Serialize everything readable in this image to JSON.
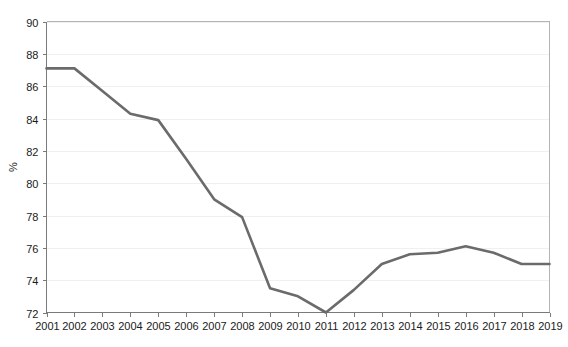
{
  "chart_data": {
    "type": "line",
    "title": "",
    "subtitle": "",
    "xlabel": "",
    "ylabel": "%",
    "categories": [
      "2001",
      "2002",
      "2003",
      "2004",
      "2005",
      "2006",
      "2007",
      "2008",
      "2009",
      "2010",
      "2011",
      "2012",
      "2013",
      "2014",
      "2015",
      "2016",
      "2017",
      "2018",
      "2019"
    ],
    "x": [
      2001,
      2002,
      2003,
      2004,
      2005,
      2006,
      2007,
      2008,
      2009,
      2010,
      2011,
      2012,
      2013,
      2014,
      2015,
      2016,
      2017,
      2018,
      2019
    ],
    "values": [
      87.1,
      87.1,
      85.7,
      84.3,
      83.9,
      81.5,
      79.0,
      77.9,
      73.5,
      73.0,
      72.0,
      73.4,
      75.0,
      75.6,
      75.7,
      76.1,
      75.7,
      75.0,
      75.0
    ],
    "series": [
      {
        "name": "",
        "color": "#6b6b6b",
        "values": [
          87.1,
          87.1,
          85.7,
          84.3,
          83.9,
          81.5,
          79.0,
          77.9,
          73.5,
          73.0,
          72.0,
          73.4,
          75.0,
          75.6,
          75.7,
          76.1,
          75.7,
          75.0,
          75.0
        ]
      }
    ],
    "ylim": [
      72,
      90
    ],
    "xlim": [
      2001,
      2019
    ],
    "yticks": [
      72,
      74,
      76,
      78,
      80,
      82,
      84,
      86,
      88,
      90
    ],
    "ytick_labels": [
      "72",
      "74",
      "76",
      "78",
      "80",
      "82",
      "84",
      "86",
      "88",
      "90"
    ],
    "xtick_labels": [
      "2001",
      "2002",
      "2003",
      "2004",
      "2005",
      "2006",
      "2007",
      "2008",
      "2009",
      "2010",
      "2011",
      "2012",
      "2013",
      "2014",
      "2015",
      "2016",
      "2017",
      "2018",
      "2019"
    ],
    "grid": true,
    "grid_axis": "y",
    "legend": false,
    "legend_position": "none",
    "annotations": []
  },
  "style": {
    "background": "#ffffff",
    "line_color": "#6b6b6b",
    "grid_color": "#f0f0f0",
    "axis_color": "#7a7a7a",
    "frame_color": "#b4b4b4",
    "text_color": "#1a1a1a"
  }
}
